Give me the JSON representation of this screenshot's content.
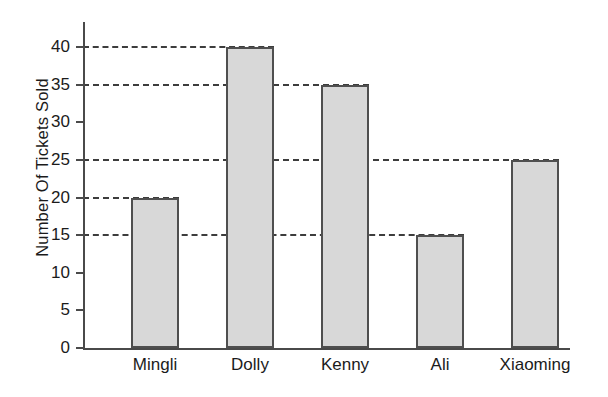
{
  "chart_data": {
    "type": "bar",
    "title": "",
    "subtitle": "",
    "xlabel": "",
    "ylabel": "Number Of Tickets Sold",
    "categories": [
      "Mingli",
      "Dolly",
      "Kenny",
      "Ali",
      "Xiaoming"
    ],
    "values": [
      20,
      40,
      35,
      15,
      25
    ],
    "series": [
      {
        "name": "Number Of Tickets Sold",
        "values": [
          20,
          40,
          35,
          15,
          25
        ]
      }
    ],
    "ylim": [
      0,
      40
    ],
    "ytick_labels": [
      "0",
      "5",
      "10",
      "15",
      "20",
      "25",
      "30",
      "35",
      "40"
    ],
    "ytick_values": [
      0,
      5,
      10,
      15,
      20,
      25,
      30,
      35,
      40
    ],
    "grid": "horizontal-dashed-at-bar-tops",
    "gridline_values": [
      15,
      20,
      25,
      35,
      40
    ],
    "legend": "none",
    "legend_position": "none",
    "annotations": [],
    "colors": {
      "bar_fill": "#d8d8d8",
      "bar_stroke": "#4f4f4f",
      "axis": "#4a4a4a",
      "gridline": "#3d3d3d",
      "text": "#1b1b1b",
      "background": "#ffffff"
    }
  },
  "axis": {
    "y_label_text": "Number Of Tickets Sold",
    "ticks": [
      {
        "label": "40",
        "value": 40
      },
      {
        "label": "35",
        "value": 35
      },
      {
        "label": "30",
        "value": 30
      },
      {
        "label": "25",
        "value": 25
      },
      {
        "label": "20",
        "value": 20
      },
      {
        "label": "15",
        "value": 15
      },
      {
        "label": "10",
        "value": 10
      },
      {
        "label": "5",
        "value": 5
      },
      {
        "label": "0",
        "value": 0
      }
    ]
  },
  "bars": [
    {
      "label": "Mingli",
      "value": 20
    },
    {
      "label": "Dolly",
      "value": 40
    },
    {
      "label": "Kenny",
      "value": 35
    },
    {
      "label": "Ali",
      "value": 15
    },
    {
      "label": "Xiaoming",
      "value": 25
    }
  ]
}
